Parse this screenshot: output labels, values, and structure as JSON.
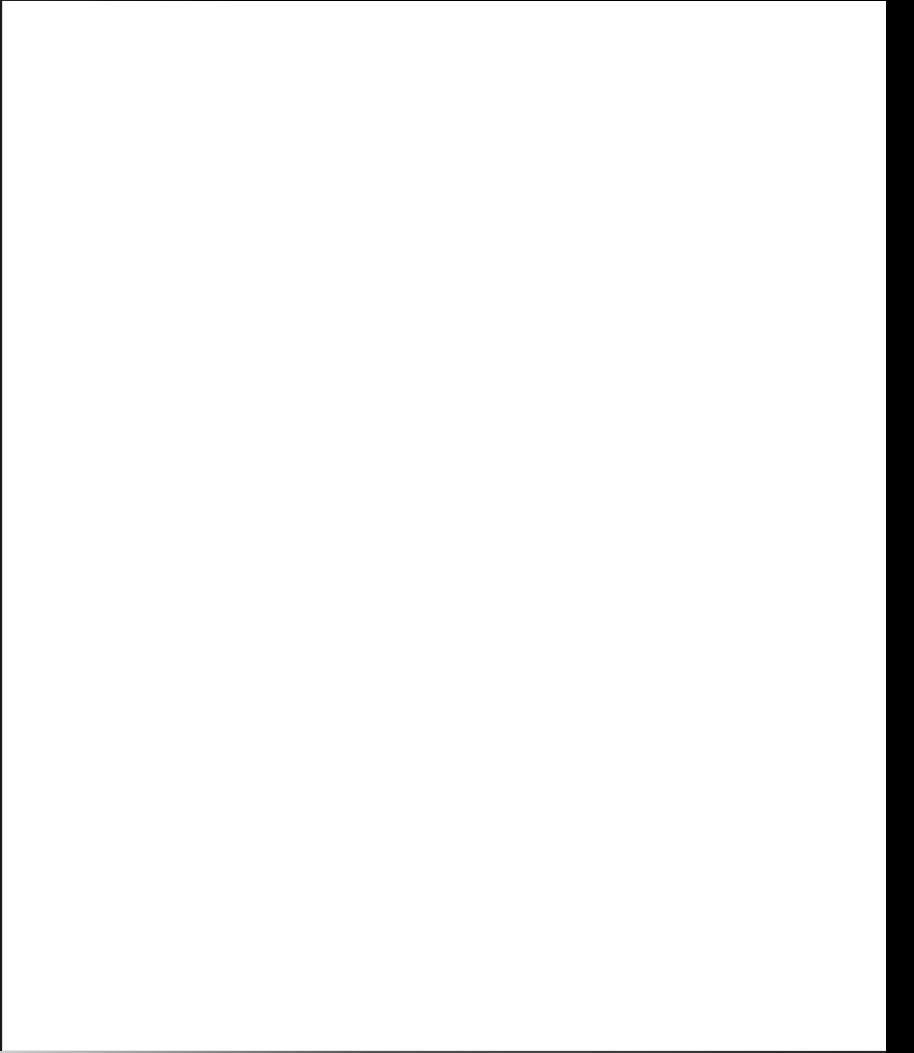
{
  "canvas": {
    "background_color": "#ffffff",
    "border_color": "#1a1a1a",
    "right_strip_color": "#000000",
    "content": []
  }
}
